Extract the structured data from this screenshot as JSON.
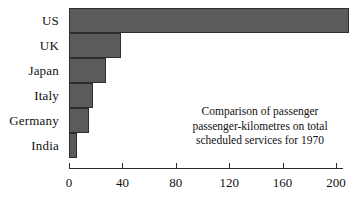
{
  "chart_data": {
    "type": "bar",
    "orientation": "horizontal",
    "title": "",
    "categories": [
      "US",
      "UK",
      "Japan",
      "Italy",
      "Germany",
      "India"
    ],
    "values": [
      210,
      39,
      28,
      18,
      15,
      6
    ],
    "xlabel": "",
    "ylabel": "",
    "xlim": [
      0,
      210
    ],
    "xticks": [
      0,
      40,
      80,
      120,
      160,
      200
    ],
    "xtick_labels": [
      "0",
      "40",
      "80",
      "120",
      "160",
      "200"
    ],
    "grid": false,
    "legend": "none",
    "bar_color": "#5b5b5b",
    "bar_edge_color": "#2e2e2e",
    "axis_color": "#2b2b2b",
    "annotations": [
      "Comparison of passenger",
      "passenger-kilometres on total",
      "scheduled services for 1970"
    ]
  },
  "caption": {
    "line1": "Comparison of passenger",
    "line2": "passenger-kilometres on total",
    "line3": "scheduled services for 1970"
  }
}
